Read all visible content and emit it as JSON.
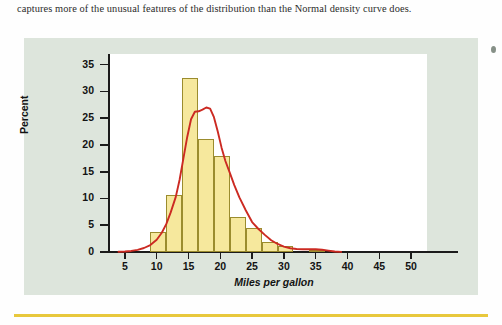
{
  "page": {
    "body_text": "captures more of the unusual features of the distribution than the Normal density curve does."
  },
  "figure": {
    "background_color": "#dde5dc",
    "plot_background_color": "#ffffff",
    "bar_fill_color": "#f6e89d",
    "bar_edge_color": "#9b8c2e",
    "curve_color": "#cc2a22",
    "rule_color": "#e8c83c"
  },
  "chart_data": {
    "type": "bar",
    "title": "",
    "xlabel": "Miles per gallon",
    "ylabel": "Percent",
    "xlim": [
      2.5,
      52.5
    ],
    "ylim": [
      0,
      37
    ],
    "grid": false,
    "legend": "none",
    "xticks": [
      5,
      10,
      15,
      20,
      25,
      30,
      35,
      40,
      45,
      50
    ],
    "xtick_labels": [
      "5",
      "10",
      "15",
      "20",
      "25",
      "30",
      "35",
      "40",
      "45",
      "50"
    ],
    "yticks": [
      0,
      5,
      10,
      15,
      20,
      25,
      30,
      35
    ],
    "ytick_labels": [
      "0",
      "5",
      "10",
      "15",
      "20",
      "25",
      "30",
      "35"
    ],
    "bin_width": 2.5,
    "bins": [
      {
        "x0": 9.0,
        "x1": 11.5,
        "value": 3.8
      },
      {
        "x0": 11.5,
        "x1": 14.0,
        "value": 10.7
      },
      {
        "x0": 14.0,
        "x1": 16.5,
        "value": 32.5
      },
      {
        "x0": 16.5,
        "x1": 19.0,
        "value": 21.2
      },
      {
        "x0": 19.0,
        "x1": 21.5,
        "value": 17.9
      },
      {
        "x0": 21.5,
        "x1": 24.0,
        "value": 6.5
      },
      {
        "x0": 24.0,
        "x1": 26.5,
        "value": 4.5
      },
      {
        "x0": 26.5,
        "x1": 29.0,
        "value": 1.9
      },
      {
        "x0": 29.0,
        "x1": 31.5,
        "value": 1.2
      },
      {
        "x0": 34.0,
        "x1": 36.5,
        "value": 0.4
      }
    ],
    "density_curve": {
      "name": "density curve",
      "color": "#cc2a22",
      "points": [
        [
          4.0,
          0.05
        ],
        [
          5.0,
          0.1
        ],
        [
          6.0,
          0.2
        ],
        [
          7.0,
          0.4
        ],
        [
          8.0,
          0.75
        ],
        [
          9.0,
          1.3
        ],
        [
          10.0,
          2.3
        ],
        [
          10.8,
          3.6
        ],
        [
          11.5,
          5.2
        ],
        [
          12.2,
          7.4
        ],
        [
          13.0,
          10.3
        ],
        [
          13.6,
          13.5
        ],
        [
          14.2,
          17.5
        ],
        [
          14.8,
          21.5
        ],
        [
          15.4,
          24.8
        ],
        [
          16.0,
          26.2
        ],
        [
          16.6,
          26.3
        ],
        [
          17.2,
          26.6
        ],
        [
          17.8,
          27.0
        ],
        [
          18.4,
          26.8
        ],
        [
          19.0,
          25.2
        ],
        [
          19.6,
          22.5
        ],
        [
          20.2,
          19.5
        ],
        [
          20.8,
          17.0
        ],
        [
          21.5,
          14.8
        ],
        [
          22.2,
          12.5
        ],
        [
          23.0,
          10.2
        ],
        [
          24.0,
          7.8
        ],
        [
          25.0,
          5.6
        ],
        [
          26.0,
          4.3
        ],
        [
          27.0,
          3.2
        ],
        [
          28.0,
          2.2
        ],
        [
          29.0,
          1.5
        ],
        [
          30.0,
          1.0
        ],
        [
          31.0,
          0.7
        ],
        [
          32.0,
          0.55
        ],
        [
          33.0,
          0.5
        ],
        [
          34.0,
          0.5
        ],
        [
          35.0,
          0.5
        ],
        [
          36.0,
          0.42
        ],
        [
          37.0,
          0.25
        ],
        [
          38.0,
          0.1
        ],
        [
          39.0,
          0.03
        ]
      ]
    }
  }
}
